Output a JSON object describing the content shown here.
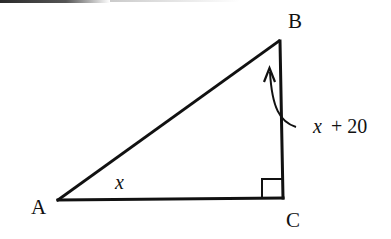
{
  "diagram": {
    "type": "right-triangle",
    "vertices": {
      "A": {
        "label": "A",
        "x": 58,
        "y": 200
      },
      "B": {
        "label": "B",
        "x": 279,
        "y": 41
      },
      "C": {
        "label": "C",
        "x": 283,
        "y": 198
      }
    },
    "right_angle_at": "C",
    "angle_labels": {
      "A": {
        "variable": "x",
        "text": "x"
      },
      "B": {
        "variable": "x",
        "plus": "+ 20",
        "text": "x + 20"
      }
    },
    "colors": {
      "stroke": "#111111",
      "background": "#ffffff"
    }
  }
}
